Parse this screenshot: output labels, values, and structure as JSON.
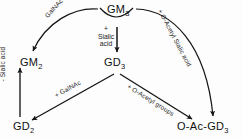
{
  "diagram": {
    "background": "#fdfdfd",
    "stroke": "#1a1a1a",
    "nodes": [
      {
        "id": "gm3",
        "label": "GM",
        "sub": "3",
        "x": 107,
        "y": 4,
        "name": "node-gm3"
      },
      {
        "id": "gm2",
        "label": "GM",
        "sub": "2",
        "x": 20,
        "y": 57,
        "name": "node-gm2"
      },
      {
        "id": "gd3",
        "label": "GD",
        "sub": "3",
        "x": 104,
        "y": 57,
        "name": "node-gd3"
      },
      {
        "id": "gd2",
        "label": "GD",
        "sub": "2",
        "x": 13,
        "y": 121,
        "name": "node-gd2"
      },
      {
        "id": "oacgd3",
        "label": "O-Ac-GD",
        "sub": "3",
        "x": 186,
        "y": 121,
        "name": "node-o-ac-gd3"
      }
    ],
    "edge_labels": [
      {
        "id": "galnac_top",
        "text": "GalNAc",
        "x": 46,
        "y": 13,
        "rot": -48,
        "name": "edge-label-galnac-top"
      },
      {
        "id": "oacsialic",
        "text": "+ O-Acetyl Sialic acid",
        "x": 160,
        "y": 6,
        "rot": 62,
        "name": "edge-label-o-acetyl-sialic-acid"
      },
      {
        "id": "sialic_minus",
        "text": "- Sialic acid",
        "x": 1,
        "y": 76,
        "rot": -90,
        "name": "edge-label-minus-sialic-acid"
      },
      {
        "id": "galnac_bot",
        "text": "+ GalNAc",
        "x": 55,
        "y": 93,
        "rot": 40,
        "name": "edge-label-plus-galnac"
      },
      {
        "id": "oacgroups",
        "text": "+ O-Acetyl groups",
        "x": 128,
        "y": 84,
        "rot": 40,
        "name": "edge-label-plus-o-acetyl-groups"
      }
    ],
    "center_label": {
      "line1": "+",
      "line2": "Sialic",
      "line3": "acid",
      "x": 97,
      "y": 26,
      "name": "center-label-plus-sialic-acid"
    }
  }
}
